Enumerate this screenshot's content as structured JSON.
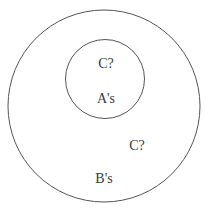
{
  "diagram": {
    "type": "euler-diagram",
    "outer_set": {
      "label": "B's",
      "unknown_label": "C?"
    },
    "inner_set": {
      "label": "A's",
      "unknown_label": "C?"
    }
  }
}
